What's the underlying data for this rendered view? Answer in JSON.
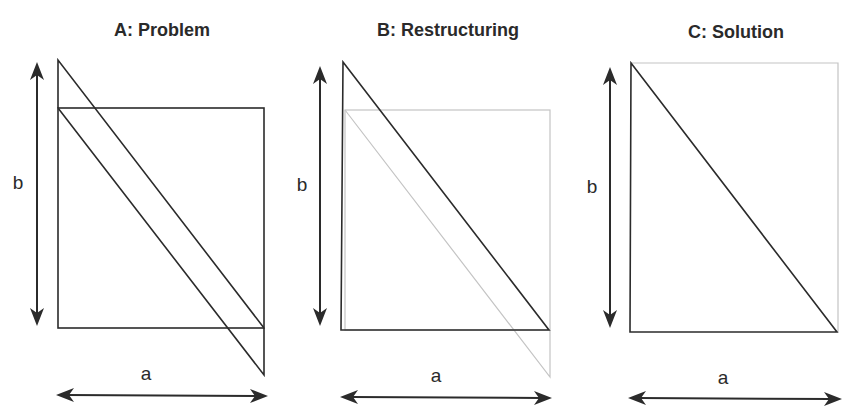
{
  "panels": [
    {
      "title": "A: Problem",
      "label_a": "a",
      "label_b": "b"
    },
    {
      "title": "B: Restructuring",
      "label_a": "a",
      "label_b": "b"
    },
    {
      "title": "C: Solution",
      "label_a": "a",
      "label_b": "b"
    }
  ],
  "colors": {
    "line_dark": "#2b2b2b",
    "line_light": "#c4c4c4",
    "background": "#ffffff"
  }
}
